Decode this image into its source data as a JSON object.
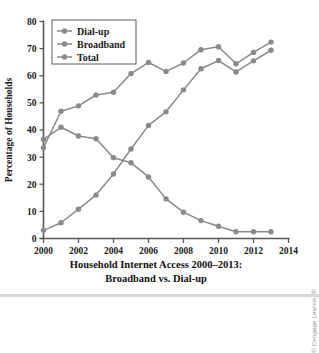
{
  "figure": {
    "caption_line1": "Household Internet Access 2000–2013:",
    "caption_line2": "Broadband vs. Dial-up",
    "credit": "© Cengage Learning®",
    "background_color": "#ffffff"
  },
  "chart_data": {
    "type": "line",
    "title": "Household Internet Access 2000–2013: Broadband vs. Dial-up",
    "xlabel": "",
    "ylabel": "Percentage of Households",
    "xlim": [
      2000,
      2014
    ],
    "ylim": [
      0,
      80
    ],
    "grid": false,
    "legend_position": "top-left",
    "x_ticks": [
      2000,
      2002,
      2004,
      2006,
      2008,
      2010,
      2012,
      2014
    ],
    "x_tick_labels": [
      "2000",
      "2002",
      "2004",
      "2006",
      "2008",
      "2010",
      "2012",
      "2014"
    ],
    "y_ticks": [
      0,
      10,
      20,
      30,
      40,
      50,
      60,
      70,
      80
    ],
    "y_tick_labels": [
      "0",
      "10",
      "20",
      "30",
      "40",
      "50",
      "60",
      "70",
      "80"
    ],
    "x": [
      2000,
      2001,
      2002,
      2003,
      2004,
      2005,
      2006,
      2007,
      2008,
      2009,
      2010,
      2011,
      2012,
      2013
    ],
    "series": [
      {
        "name": "Dial-up",
        "color": "#8a8a8c",
        "marker": "circle",
        "values": [
          36.5,
          41.0,
          37.8,
          36.8,
          29.8,
          27.9,
          22.7,
          14.6,
          9.7,
          6.6,
          4.5,
          2.5,
          2.5,
          2.5
        ]
      },
      {
        "name": "Broadband",
        "color": "#8a8a8c",
        "marker": "circle",
        "values": [
          3.0,
          5.8,
          10.8,
          16.0,
          23.8,
          33.0,
          41.7,
          46.7,
          54.8,
          62.6,
          65.6,
          61.4,
          65.5,
          69.4
        ]
      },
      {
        "name": "Total",
        "color": "#8a8a8c",
        "marker": "circle",
        "values": [
          33.5,
          46.9,
          48.9,
          52.9,
          53.9,
          60.8,
          64.9,
          61.6,
          64.7,
          69.6,
          70.7,
          64.4,
          68.6,
          72.4
        ]
      }
    ],
    "legend": [
      "Dial-up",
      "Broadband",
      "Total"
    ]
  }
}
